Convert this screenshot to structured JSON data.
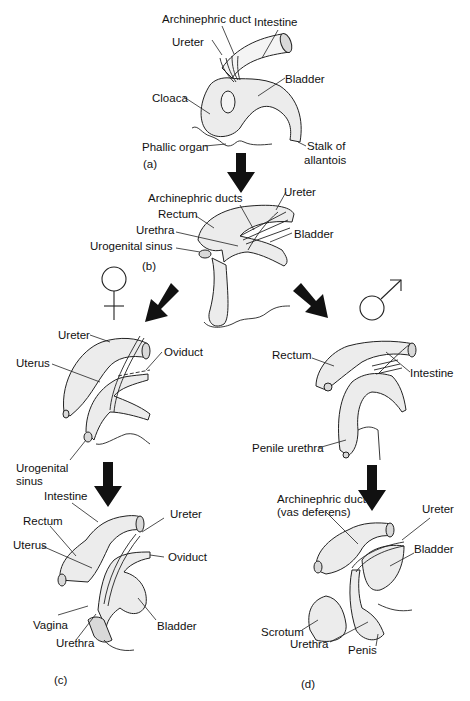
{
  "figure": {
    "panels": {
      "a": {
        "tag": "(a)",
        "labels": {
          "archinephric_duct": "Archinephric duct",
          "intestine": "Intestine",
          "ureter": "Ureter",
          "bladder": "Bladder",
          "cloaca": "Cloaca",
          "phallic_organ": "Phallic organ",
          "stalk_line1": "Stalk of",
          "stalk_line2": "allantois"
        }
      },
      "b": {
        "tag": "(b)",
        "labels": {
          "archinephric_ducts": "Archinephric ducts",
          "ureter": "Ureter",
          "rectum": "Rectum",
          "urethra": "Urethra",
          "bladder": "Bladder",
          "urogenital_sinus": "Urogenital sinus"
        }
      },
      "female_intermediate": {
        "symbol": "female-symbol",
        "labels": {
          "ureter": "Ureter",
          "uterus": "Uterus",
          "oviduct": "Oviduct",
          "urogenital_line1": "Urogenital",
          "urogenital_line2": "sinus"
        }
      },
      "c": {
        "tag": "(c)",
        "labels": {
          "intestine": "Intestine",
          "rectum": "Rectum",
          "ureter": "Ureter",
          "uterus": "Uterus",
          "oviduct": "Oviduct",
          "vagina": "Vagina",
          "bladder": "Bladder",
          "urethra": "Urethra"
        }
      },
      "male_intermediate": {
        "symbol": "male-symbol",
        "labels": {
          "rectum": "Rectum",
          "intestine": "Intestine",
          "penile_urethra": "Penile urethra"
        }
      },
      "d": {
        "tag": "(d)",
        "labels": {
          "archinephric_line1": "Archinephric duct",
          "archinephric_line2": "(vas deferens)",
          "ureter": "Ureter",
          "bladder": "Bladder",
          "scrotum": "Scrotum",
          "urethra": "Urethra",
          "penis": "Penis"
        }
      }
    }
  }
}
